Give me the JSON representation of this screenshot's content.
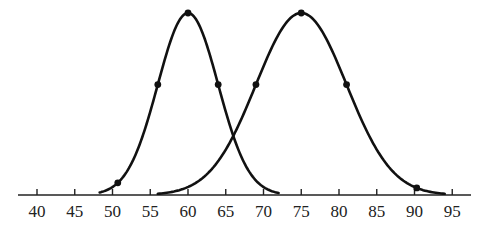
{
  "chart_data": {
    "type": "line",
    "title": "",
    "xlabel": "",
    "ylabel": "",
    "xlim": [
      37.5,
      97.5
    ],
    "grid": false,
    "legend": null,
    "x_ticks": [
      40,
      45,
      50,
      55,
      60,
      65,
      70,
      75,
      80,
      85,
      90,
      95
    ],
    "series": [
      {
        "name": "Normal curve 1",
        "kind": "normal",
        "mean": 60,
        "sd": 4,
        "x_range": [
          48.3,
          72
        ],
        "marked_points_x": [
          50.7,
          56,
          60,
          64
        ]
      },
      {
        "name": "Normal curve 2",
        "kind": "normal",
        "mean": 75,
        "sd": 6,
        "x_range": [
          56,
          94
        ],
        "marked_points_x": [
          69,
          75,
          81,
          90.3
        ]
      }
    ],
    "intersection_x": 65.8
  },
  "layout": {
    "axis_y": 195,
    "axis_x_start": 18,
    "axis_x_end": 471,
    "x0_value": 40,
    "x0_px": 37,
    "px_per_unit": 7.55,
    "peak_y": 13,
    "baseline_y": 195
  }
}
